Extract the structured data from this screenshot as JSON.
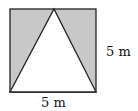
{
  "diagram": {
    "shapes": {
      "square": {
        "side": "5 m"
      },
      "triangle": {
        "base": "bottom side of square",
        "apex": "midpoint of top side"
      }
    },
    "labels": {
      "right_side": "5 m",
      "bottom_side": "5 m"
    },
    "colors": {
      "shaded": "#c8c8c8",
      "stroke": "#222222",
      "background": "#ffffff"
    }
  }
}
